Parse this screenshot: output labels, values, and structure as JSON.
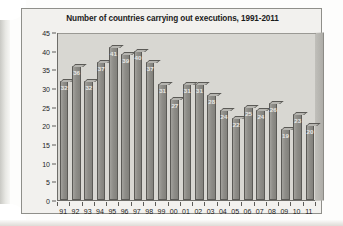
{
  "figure": {
    "title": "Number of countries carrying out executions, 1991-2011"
  },
  "chart_data": {
    "type": "bar",
    "title": "Number of countries carrying out executions, 1991-2011",
    "xlabel": "",
    "ylabel": "",
    "ylim": [
      0,
      45
    ],
    "ytick_step": 5,
    "yticks": [
      "0",
      "5",
      "10",
      "15",
      "20",
      "25",
      "30",
      "35",
      "40",
      "45"
    ],
    "grid": false,
    "legend": "none",
    "categories": [
      "91",
      "92",
      "93",
      "94",
      "95",
      "96",
      "97",
      "98",
      "99",
      "00",
      "01",
      "02",
      "03",
      "04",
      "05",
      "06",
      "07",
      "08",
      "09",
      "10",
      "11"
    ],
    "values": [
      32,
      36,
      32,
      37,
      41,
      39,
      40,
      37,
      31,
      27,
      31,
      31,
      28,
      24,
      22,
      25,
      24,
      26,
      19,
      23,
      20
    ],
    "bar_labels": [
      "32",
      "36",
      "32",
      "37",
      "41",
      "39",
      "40",
      "37",
      "31",
      "27",
      "31",
      "31",
      "28",
      "24",
      "22",
      "25",
      "24",
      "26",
      "19",
      "23",
      "20"
    ],
    "colors": {
      "bar_fill": "#8e8d88",
      "bar_border": "#5b5a56",
      "plot_background": "#d8d7d2",
      "figure_background": "#f2f1ee",
      "axis": "#6e6d69",
      "label_text": "#e9e9e6",
      "title_text": "#1b1b1b"
    }
  }
}
